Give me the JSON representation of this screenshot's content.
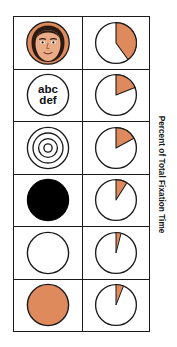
{
  "figure": {
    "axis_label": "Percent of Total Fixation Time",
    "colors": {
      "accent_orange": "#DE8A5C",
      "outline": "#1b1b1b",
      "background": "#ffffff",
      "black_fill": "#000000",
      "skin": "#E8A884",
      "hair": "#2b1a12"
    }
  },
  "chart_data": {
    "type": "pie",
    "title": "",
    "xlabel": "",
    "ylabel": "Percent of Total Fixation Time",
    "grid": false,
    "legend": "none",
    "units": "percent",
    "note": "Six small pie charts, one per stimulus row; orange wedge starts at 12 o'clock and sweeps clockwise showing percent of total fixation time.",
    "categories": [
      "face",
      "text",
      "concentric-circles",
      "black-disc",
      "white-disc",
      "orange-disc"
    ],
    "values": [
      40,
      19,
      17,
      9,
      4,
      6
    ],
    "rows": [
      {
        "index": 0,
        "stimulus": "face",
        "stimulus_label": "",
        "stimulus_type": "face-image",
        "percent": 40,
        "pie_slices": [
          {
            "name": "fixation",
            "value": 40,
            "color": "#DE8A5C"
          },
          {
            "name": "remainder",
            "value": 60,
            "color": "#ffffff"
          }
        ]
      },
      {
        "index": 1,
        "stimulus": "text",
        "stimulus_label": "abc def",
        "stimulus_line1": "abc",
        "stimulus_line2": "def",
        "stimulus_type": "text-circle",
        "percent": 19,
        "pie_slices": [
          {
            "name": "fixation",
            "value": 19,
            "color": "#DE8A5C"
          },
          {
            "name": "remainder",
            "value": 81,
            "color": "#ffffff"
          }
        ]
      },
      {
        "index": 2,
        "stimulus": "concentric-circles",
        "stimulus_label": "",
        "stimulus_type": "bullseye",
        "percent": 17,
        "pie_slices": [
          {
            "name": "fixation",
            "value": 17,
            "color": "#DE8A5C"
          },
          {
            "name": "remainder",
            "value": 83,
            "color": "#ffffff"
          }
        ]
      },
      {
        "index": 3,
        "stimulus": "black-disc",
        "stimulus_label": "",
        "stimulus_type": "filled-circle-black",
        "percent": 9,
        "pie_slices": [
          {
            "name": "fixation",
            "value": 9,
            "color": "#DE8A5C"
          },
          {
            "name": "remainder",
            "value": 91,
            "color": "#ffffff"
          }
        ]
      },
      {
        "index": 4,
        "stimulus": "white-disc",
        "stimulus_label": "",
        "stimulus_type": "outline-circle",
        "percent": 4,
        "pie_slices": [
          {
            "name": "fixation",
            "value": 4,
            "color": "#DE8A5C"
          },
          {
            "name": "remainder",
            "value": 96,
            "color": "#ffffff"
          }
        ]
      },
      {
        "index": 5,
        "stimulus": "orange-disc",
        "stimulus_label": "",
        "stimulus_type": "filled-circle-orange",
        "percent": 6,
        "pie_slices": [
          {
            "name": "fixation",
            "value": 6,
            "color": "#DE8A5C"
          },
          {
            "name": "remainder",
            "value": 94,
            "color": "#ffffff"
          }
        ]
      }
    ]
  }
}
